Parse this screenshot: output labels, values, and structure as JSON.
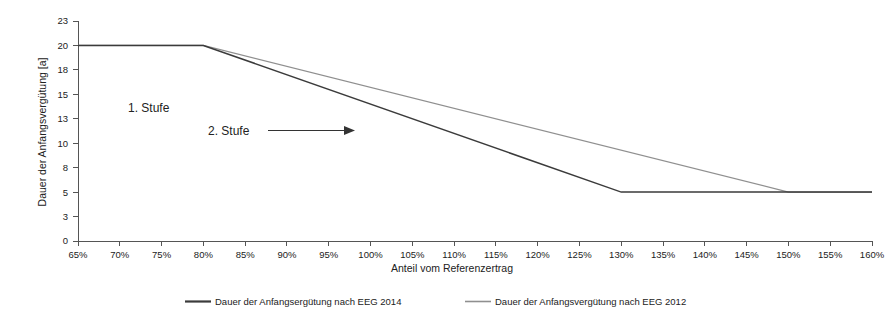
{
  "chart_data": {
    "type": "line",
    "title": "",
    "xlabel": "Anteil vom Referenzertrag",
    "ylabel": "Dauer der Anfangsvergütung [a]",
    "x_tick_labels": [
      "65%",
      "70%",
      "75%",
      "80%",
      "85%",
      "90%",
      "95%",
      "100%",
      "105%",
      "110%",
      "115%",
      "120%",
      "125%",
      "130%",
      "135%",
      "140%",
      "145%",
      "150%",
      "155%",
      "160%"
    ],
    "x_tick_values": [
      65,
      70,
      75,
      80,
      85,
      90,
      95,
      100,
      105,
      110,
      115,
      120,
      125,
      130,
      135,
      140,
      145,
      150,
      155,
      160
    ],
    "y_tick_labels": [
      "23",
      "20",
      "18",
      "15",
      "13",
      "10",
      "8",
      "5",
      "3",
      "0"
    ],
    "y_tick_values": [
      23,
      20,
      18,
      15,
      13,
      10,
      8,
      5,
      3,
      0
    ],
    "xlim": [
      65,
      160
    ],
    "ylim": [
      0,
      23
    ],
    "grid": false,
    "legend_position": "bottom",
    "series": [
      {
        "name": "Dauer der Anfangsergütung nach EEG 2014",
        "color": "#3b3b3b",
        "x": [
          65,
          80,
          130,
          160
        ],
        "values": [
          20,
          20,
          5,
          5
        ]
      },
      {
        "name": "Dauer der Anfangsvergütung nach EEG 2012",
        "color": "#8f8f8f",
        "x": [
          65,
          80,
          150,
          160
        ],
        "values": [
          20,
          20,
          5,
          5
        ]
      }
    ],
    "annotations": [
      {
        "text": "1. Stufe",
        "x": 76,
        "y": 14
      },
      {
        "text": "2. Stufe",
        "x": 88,
        "y": 11.5
      }
    ]
  },
  "legend": {
    "items": [
      {
        "label": "Dauer der Anfangsergütung nach EEG 2014"
      },
      {
        "label": "Dauer der Anfangsvergütung nach EEG 2012"
      }
    ]
  },
  "axes": {
    "y_title": "Dauer der Anfangsvergütung [a]",
    "x_title": "Anteil vom Referenzertrag"
  }
}
